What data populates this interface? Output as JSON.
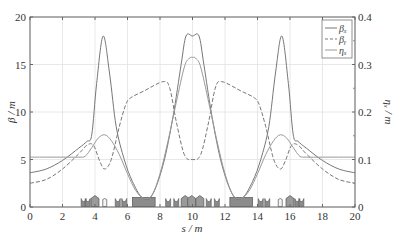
{
  "chart_data": {
    "type": "line",
    "title": "",
    "xlabel": "s / m",
    "ylabel": "β / m",
    "y2label": "η_x / m",
    "xlim": [
      0,
      20
    ],
    "ylim": [
      0,
      20
    ],
    "y2lim": [
      0,
      0.4
    ],
    "xticks": [
      "0",
      "2",
      "4",
      "6",
      "8",
      "10",
      "12",
      "14",
      "16",
      "18",
      "20"
    ],
    "yticks": [
      "0",
      "5",
      "10",
      "15",
      "20"
    ],
    "y2ticks": [
      "0",
      "0.1",
      "0.2",
      "0.3",
      "0.4"
    ],
    "grid": true,
    "legend": {
      "position": "upper right",
      "entries": [
        {
          "label": "β_x",
          "style": "solid"
        },
        {
          "label": "β_y",
          "style": "dashed"
        },
        {
          "label": "η_x",
          "style": "solid"
        }
      ]
    },
    "series": [
      {
        "name": "β_x",
        "axis": "left",
        "style": "solid",
        "color": "#777777",
        "x": [
          0,
          1,
          2,
          3,
          3.5,
          3.8,
          4.1,
          4.5,
          4.9,
          5.3,
          5.8,
          6.3,
          6.9,
          7.5,
          8.2,
          8.8,
          9.3,
          9.6,
          10.0,
          10.4,
          10.7,
          11.2,
          11.8,
          12.5,
          13.1,
          13.7,
          14.2,
          14.7,
          15.1,
          15.5,
          15.9,
          16.2,
          16.5,
          17,
          18,
          19,
          20
        ],
        "y": [
          3.6,
          4.0,
          4.9,
          6.2,
          6.9,
          7.6,
          13.0,
          18.0,
          14.0,
          8.5,
          5.0,
          2.7,
          1.0,
          1.2,
          4.5,
          9.5,
          15.0,
          18.0,
          18.0,
          18.0,
          15.0,
          9.5,
          4.5,
          1.2,
          1.0,
          2.7,
          5.0,
          8.5,
          14.0,
          18.0,
          13.0,
          7.6,
          6.9,
          6.2,
          4.9,
          4.0,
          3.6
        ]
      },
      {
        "name": "β_y",
        "axis": "left",
        "style": "dashed",
        "color": "#777777",
        "x": [
          0,
          1,
          2,
          3,
          3.5,
          3.9,
          4.3,
          4.6,
          5.0,
          5.5,
          5.9,
          6.2,
          7.0,
          8.2,
          8.6,
          9.0,
          9.5,
          10.0,
          10.5,
          11.0,
          11.4,
          11.8,
          13.0,
          13.8,
          14.1,
          14.5,
          15.0,
          15.4,
          15.7,
          16.1,
          16.5,
          17,
          18,
          19,
          20
        ],
        "y": [
          2.5,
          2.9,
          4.0,
          5.6,
          6.5,
          6.5,
          4.8,
          4.0,
          5.0,
          8.5,
          10.8,
          11.5,
          12.2,
          13.2,
          12.5,
          9.0,
          5.5,
          5.0,
          5.5,
          9.0,
          12.5,
          13.2,
          12.2,
          11.5,
          10.8,
          8.5,
          5.0,
          4.0,
          4.8,
          6.5,
          6.5,
          5.6,
          4.0,
          2.9,
          2.5
        ]
      },
      {
        "name": "η_x",
        "axis": "right",
        "style": "solid",
        "color": "#999999",
        "x": [
          0,
          1,
          2,
          3,
          3.4,
          3.8,
          4.2,
          4.6,
          5.0,
          5.5,
          6.0,
          6.5,
          7.0,
          7.5,
          8.0,
          8.5,
          9.0,
          9.5,
          9.8,
          10.0,
          10.2,
          10.5,
          11.0,
          11.5,
          12.0,
          12.5,
          13.0,
          13.5,
          14.0,
          14.5,
          15.0,
          15.4,
          15.8,
          16.2,
          16.6,
          17,
          18,
          19,
          20
        ],
        "y": [
          0.105,
          0.105,
          0.105,
          0.105,
          0.107,
          0.125,
          0.145,
          0.152,
          0.14,
          0.11,
          0.07,
          0.035,
          0.018,
          0.025,
          0.07,
          0.14,
          0.22,
          0.295,
          0.313,
          0.315,
          0.313,
          0.295,
          0.22,
          0.14,
          0.07,
          0.025,
          0.018,
          0.035,
          0.07,
          0.11,
          0.14,
          0.152,
          0.145,
          0.125,
          0.107,
          0.105,
          0.105,
          0.105,
          0.105
        ]
      }
    ],
    "magnet_lattice": [
      {
        "type": "sextupole",
        "s": 3.3
      },
      {
        "type": "sextupole",
        "s": 3.55
      },
      {
        "type": "quadrupole",
        "s": 4.0
      },
      {
        "type": "dipole-small",
        "s": 4.6
      },
      {
        "type": "sextupole",
        "s": 5.4
      },
      {
        "type": "sextupole",
        "s": 5.8
      },
      {
        "type": "dipole",
        "s_start": 6.3,
        "s_end": 7.7
      },
      {
        "type": "sextupole",
        "s": 8.5
      },
      {
        "type": "sextupole",
        "s": 9.0
      },
      {
        "type": "quadrupole",
        "s": 9.55
      },
      {
        "type": "quadrupole",
        "s": 9.95
      },
      {
        "type": "quadrupole",
        "s": 10.45
      },
      {
        "type": "sextupole",
        "s": 11.0
      },
      {
        "type": "sextupole",
        "s": 11.5
      },
      {
        "type": "dipole",
        "s_start": 12.3,
        "s_end": 13.7
      },
      {
        "type": "sextupole",
        "s": 14.2
      },
      {
        "type": "sextupole",
        "s": 14.6
      },
      {
        "type": "dipole-small",
        "s": 15.4
      },
      {
        "type": "quadrupole",
        "s": 16.0
      },
      {
        "type": "sextupole",
        "s": 16.45
      },
      {
        "type": "sextupole",
        "s": 16.7
      }
    ]
  }
}
